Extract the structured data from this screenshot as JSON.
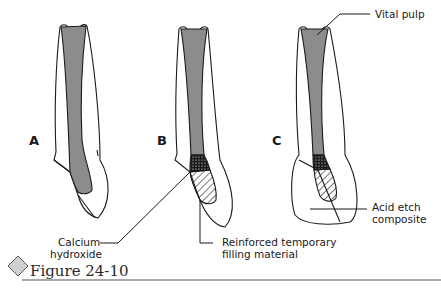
{
  "figure": {
    "caption": "Figure 24-10",
    "panels": [
      {
        "letter": "A"
      },
      {
        "letter": "B"
      },
      {
        "letter": "C"
      }
    ],
    "labels": {
      "vital_pulp": "Vital pulp",
      "calcium_hydroxide_1": "Calcium",
      "calcium_hydroxide_2": "hydroxide",
      "reinforced_1": "Reinforced temporary",
      "reinforced_2": "filling material",
      "acid_etch_1": "Acid etch",
      "acid_etch_2": "composite"
    },
    "colors": {
      "pulp": "#8c8c8c",
      "outline": "#1a1a1a",
      "caption_diamond": "#d0d0d0",
      "rule": "#555555"
    }
  }
}
